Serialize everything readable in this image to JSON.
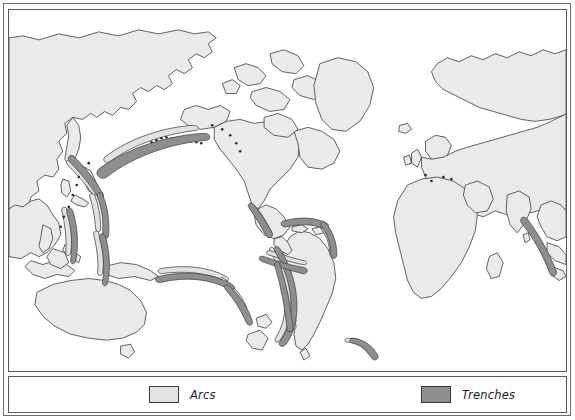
{
  "figure": {
    "type": "map",
    "projection": "cylindrical-equirectangular",
    "ocean_color": "#ffffff",
    "land_color": "#eaeaea",
    "coastline_color": "#3a3a3a",
    "frame_color": "#5a5a5a"
  },
  "legend": {
    "items": [
      {
        "label": "Arcs",
        "swatch": "arc-swatch",
        "color": "#e2e2e2"
      },
      {
        "label": "Trenches",
        "swatch": "trench-swatch",
        "color": "#8e8e8e"
      }
    ]
  },
  "map_features": {
    "arcs": [
      {
        "name": "Aleutian arc"
      },
      {
        "name": "Kuril-Kamchatka arc"
      },
      {
        "name": "Japan arc"
      },
      {
        "name": "Izu-Bonin arc"
      },
      {
        "name": "Mariana arc"
      },
      {
        "name": "Philippine arc"
      },
      {
        "name": "New Britain - Solomon arc"
      },
      {
        "name": "New Hebrides arc"
      },
      {
        "name": "Tonga-Kermadec arc"
      },
      {
        "name": "Sunda-Java arc"
      },
      {
        "name": "Lesser Antilles arc"
      },
      {
        "name": "Scotia (South Sandwich) arc"
      },
      {
        "name": "Middle America arc"
      },
      {
        "name": "Cascadia arc"
      },
      {
        "name": "Andean arc"
      }
    ],
    "trenches": [
      {
        "name": "Aleutian Trench"
      },
      {
        "name": "Kuril-Kamchatka Trench"
      },
      {
        "name": "Japan Trench"
      },
      {
        "name": "Izu-Bonin Trench"
      },
      {
        "name": "Mariana Trench"
      },
      {
        "name": "Philippine Trench"
      },
      {
        "name": "New Britain Trench"
      },
      {
        "name": "New Hebrides Trench"
      },
      {
        "name": "Tonga-Kermadec Trench"
      },
      {
        "name": "Java (Sunda) Trench"
      },
      {
        "name": "Puerto Rico Trench"
      },
      {
        "name": "South Sandwich Trench"
      },
      {
        "name": "Middle America Trench"
      },
      {
        "name": "Peru-Chile Trench"
      }
    ]
  }
}
